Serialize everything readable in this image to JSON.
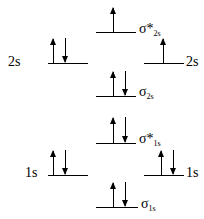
{
  "diagram": {
    "type": "molecular-orbital-energy-diagram",
    "atomic_orbitals": [
      {
        "id": "ao-2s-left",
        "label": "2s",
        "side": "left",
        "electrons": [
          "up",
          "down"
        ]
      },
      {
        "id": "ao-2s-right",
        "label": "2s",
        "side": "right",
        "electrons": [
          "up"
        ]
      },
      {
        "id": "ao-1s-left",
        "label": "1s",
        "side": "left",
        "electrons": [
          "up",
          "down"
        ]
      },
      {
        "id": "ao-1s-right",
        "label": "1s",
        "side": "right",
        "electrons": [
          "up",
          "down"
        ]
      }
    ],
    "molecular_orbitals": [
      {
        "id": "mo-sigma-star-2s",
        "symbol": "σ*",
        "subscript": "2s",
        "electrons": [
          "up"
        ]
      },
      {
        "id": "mo-sigma-2s",
        "symbol": "σ",
        "subscript": "2s",
        "electrons": [
          "up",
          "down"
        ]
      },
      {
        "id": "mo-sigma-star-1s",
        "symbol": "σ*",
        "subscript": "1s",
        "electrons": [
          "up",
          "down"
        ]
      },
      {
        "id": "mo-sigma-1s",
        "symbol": "σ",
        "subscript": "1s",
        "electrons": [
          "up",
          "down"
        ]
      }
    ]
  },
  "labels": {
    "left_2s": "2s",
    "right_2s": "2s",
    "left_1s": "1s",
    "right_1s": "1s",
    "sigma_star_2s_symbol": "σ*",
    "sigma_star_2s_sub": "2s",
    "sigma_2s_symbol": "σ",
    "sigma_2s_sub": "2s",
    "sigma_star_1s_symbol": "σ*",
    "sigma_star_1s_sub": "1s",
    "sigma_1s_symbol": "σ",
    "sigma_1s_sub": "1s"
  }
}
